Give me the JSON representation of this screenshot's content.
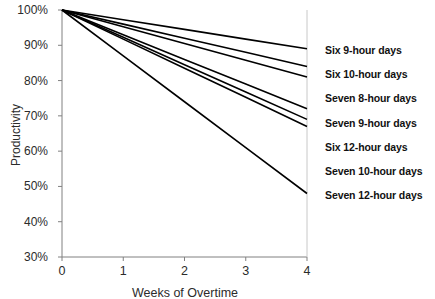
{
  "chart_data": {
    "type": "line",
    "title": "",
    "subtitle": "",
    "xlabel": "Weeks of Overtime",
    "ylabel": "Productivity",
    "x": [
      0,
      1,
      2,
      3,
      4
    ],
    "xlim": [
      0,
      4
    ],
    "ylim": [
      30,
      100
    ],
    "xticks": [
      "0",
      "1",
      "2",
      "3",
      "4"
    ],
    "yticks": [
      "30%",
      "40%",
      "50%",
      "60%",
      "70%",
      "80%",
      "90%",
      "100%"
    ],
    "ytick_values": [
      30,
      40,
      50,
      60,
      70,
      80,
      90,
      100
    ],
    "grid": false,
    "legend_position": "right-inline-labels",
    "line_color": "#000000",
    "axis_color": "#808080",
    "series": [
      {
        "name": "Six 9-hour days",
        "values": [
          100,
          97.25,
          94.5,
          91.75,
          89
        ]
      },
      {
        "name": "Six 10-hour days",
        "values": [
          100,
          96,
          92,
          88,
          84
        ]
      },
      {
        "name": "Seven 8-hour days",
        "values": [
          100,
          95.25,
          90.5,
          85.75,
          81
        ]
      },
      {
        "name": "Seven 9-hour days",
        "values": [
          100,
          93,
          86,
          79,
          72
        ]
      },
      {
        "name": "Six 12-hour days",
        "values": [
          100,
          92.25,
          84.5,
          76.75,
          69
        ]
      },
      {
        "name": "Seven 10-hour days",
        "values": [
          100,
          91.75,
          83.5,
          75.25,
          67
        ]
      },
      {
        "name": "Seven 12-hour days",
        "values": [
          100,
          87,
          74,
          61,
          48
        ]
      }
    ]
  }
}
